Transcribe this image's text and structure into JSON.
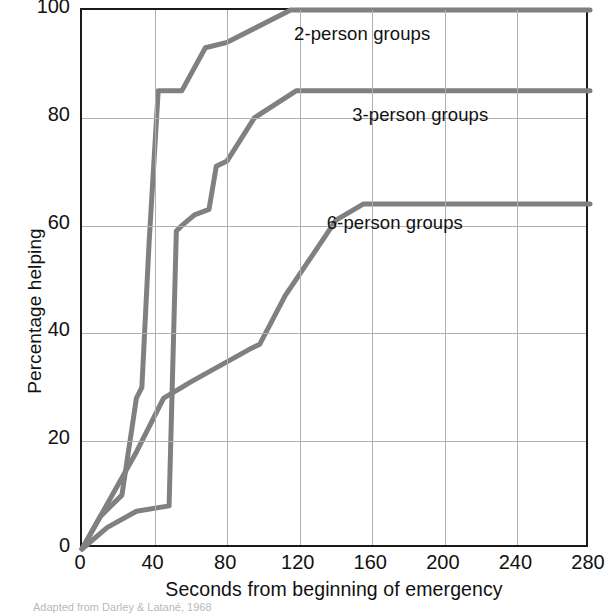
{
  "chart_data": {
    "type": "line",
    "title": "",
    "xlabel": "Seconds from beginning of emergency",
    "ylabel": "Percentage helping",
    "xlim": [
      0,
      280
    ],
    "ylim": [
      0,
      100
    ],
    "xticks": [
      0,
      40,
      80,
      120,
      160,
      200,
      240,
      280
    ],
    "yticks": [
      0,
      20,
      40,
      60,
      80,
      100
    ],
    "grid": true,
    "legend_position": "inline-annotations",
    "line_color": "#808080",
    "axis_color": "#1a1a1a",
    "grid_color": "#b0b0b0",
    "series": [
      {
        "name": "2-person groups",
        "label": "2-person groups",
        "label_x": 118,
        "label_y": 95,
        "points": [
          [
            0,
            0
          ],
          [
            10,
            6
          ],
          [
            22,
            10
          ],
          [
            30,
            28
          ],
          [
            33,
            30
          ],
          [
            37,
            57
          ],
          [
            42,
            85
          ],
          [
            55,
            85
          ],
          [
            68,
            93
          ],
          [
            80,
            94
          ],
          [
            115,
            100
          ],
          [
            280,
            100
          ]
        ]
      },
      {
        "name": "3-person groups",
        "label": "3-person groups",
        "label_x": 150,
        "label_y": 80,
        "points": [
          [
            0,
            0
          ],
          [
            14,
            4
          ],
          [
            30,
            7
          ],
          [
            48,
            8
          ],
          [
            52,
            59
          ],
          [
            55,
            60
          ],
          [
            62,
            62
          ],
          [
            70,
            63
          ],
          [
            74,
            71
          ],
          [
            80,
            72
          ],
          [
            95,
            80
          ],
          [
            118,
            85
          ],
          [
            280,
            85
          ]
        ]
      },
      {
        "name": "6-person groups",
        "label": "6-person groups",
        "label_x": 136,
        "label_y": 60,
        "points": [
          [
            0,
            0
          ],
          [
            20,
            12
          ],
          [
            30,
            18
          ],
          [
            45,
            28
          ],
          [
            55,
            30
          ],
          [
            60,
            31
          ],
          [
            92,
            37
          ],
          [
            98,
            38
          ],
          [
            112,
            47
          ],
          [
            128,
            55
          ],
          [
            140,
            61
          ],
          [
            155,
            64
          ],
          [
            280,
            64
          ]
        ]
      }
    ]
  },
  "caption": {
    "source": "Adapted from Darley & Latané, 1968"
  },
  "axis": {
    "xlabel": "Seconds from beginning of emergency",
    "ylabel": "Percentage helping"
  }
}
